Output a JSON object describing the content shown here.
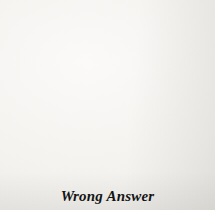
{
  "figure": {
    "kind": "go-board-diagram",
    "caption": "Wrong Answer",
    "board": {
      "columns": 12,
      "rows": 11,
      "left_px": 19,
      "top_px": 13,
      "spacing_px": 16.727,
      "line_color": "#2a2a2a",
      "edge_color": "#161616",
      "background_color": "#f3f2ef"
    },
    "hoshi": [
      {
        "col": 2,
        "row": 9
      },
      {
        "col": 8,
        "row": 9
      }
    ],
    "stones": [
      {
        "col": 2,
        "row": 0,
        "color": "black",
        "label": ""
      },
      {
        "col": 3,
        "row": 0,
        "color": "white",
        "label": ""
      },
      {
        "col": 4,
        "row": 0,
        "color": "white",
        "label": ""
      },
      {
        "col": 5,
        "row": 0,
        "color": "black",
        "label": "1"
      },
      {
        "col": 6,
        "row": 0,
        "color": "white",
        "label": "2"
      },
      {
        "col": 7,
        "row": 0,
        "color": "white",
        "label": ""
      },
      {
        "col": 1,
        "row": 1,
        "color": "white",
        "label": ""
      },
      {
        "col": 2,
        "row": 1,
        "color": "black",
        "label": ""
      },
      {
        "col": 3,
        "row": 1,
        "color": "black",
        "label": ""
      },
      {
        "col": 4,
        "row": 1,
        "color": "black",
        "label": ""
      },
      {
        "col": 5,
        "row": 1,
        "color": "white",
        "label": ""
      },
      {
        "col": 6,
        "row": 1,
        "color": "white",
        "label": ""
      },
      {
        "col": 7,
        "row": 1,
        "color": "black",
        "label": ""
      },
      {
        "col": 8,
        "row": 1,
        "color": "white",
        "label": ""
      },
      {
        "col": 1,
        "row": 2,
        "color": "white",
        "label": ""
      },
      {
        "col": 4,
        "row": 2,
        "color": "black",
        "label": ""
      },
      {
        "col": 5,
        "row": 2,
        "color": "white",
        "label": ""
      },
      {
        "col": 7,
        "row": 2,
        "color": "black",
        "label": ""
      },
      {
        "col": 8,
        "row": 2,
        "color": "white",
        "label": ""
      },
      {
        "col": 2,
        "row": 3,
        "color": "white",
        "label": ""
      },
      {
        "col": 3,
        "row": 3,
        "color": "white",
        "label": ""
      },
      {
        "col": 4,
        "row": 3,
        "color": "white",
        "label": ""
      },
      {
        "col": 5,
        "row": 3,
        "color": "black",
        "label": ""
      },
      {
        "col": 6,
        "row": 3,
        "color": "black",
        "label": ""
      },
      {
        "col": 8,
        "row": 3,
        "color": "white",
        "label": ""
      }
    ]
  }
}
